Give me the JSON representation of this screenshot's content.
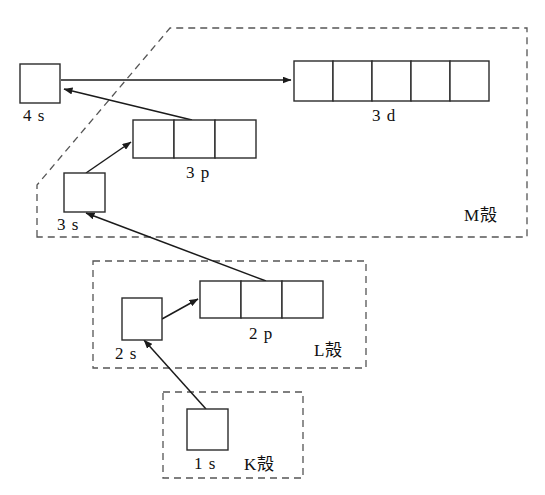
{
  "diagram": {
    "background_color": "#ffffff",
    "box_stroke_color": "#2b2b2b",
    "shell_stroke_color": "#555555",
    "arrow_color": "#1b1b1b"
  },
  "orbitals": [
    {
      "id": "4s",
      "label": "4 s",
      "boxes": 1,
      "x": 20,
      "y": 64,
      "box_w": 40,
      "box_h": 39,
      "label_x": 23,
      "label_y": 121
    },
    {
      "id": "3d",
      "label": "3 d",
      "boxes": 5,
      "x": 294,
      "y": 61,
      "box_w": 39,
      "box_h": 40,
      "label_x": 372,
      "label_y": 121
    },
    {
      "id": "3p",
      "label": "3 p",
      "boxes": 3,
      "x": 133,
      "y": 120,
      "box_w": 41,
      "box_h": 38,
      "label_x": 186,
      "label_y": 178
    },
    {
      "id": "3s",
      "label": "3 s",
      "boxes": 1,
      "x": 64,
      "y": 173,
      "box_w": 41,
      "box_h": 39,
      "label_x": 57,
      "label_y": 230
    },
    {
      "id": "2p",
      "label": "2 p",
      "boxes": 3,
      "x": 200,
      "y": 281,
      "box_w": 41,
      "box_h": 37,
      "label_x": 249,
      "label_y": 339
    },
    {
      "id": "2s",
      "label": "2 s",
      "boxes": 1,
      "x": 122,
      "y": 298,
      "box_w": 40,
      "box_h": 42,
      "label_x": 115,
      "label_y": 359
    },
    {
      "id": "1s",
      "label": "1 s",
      "boxes": 1,
      "x": 187,
      "y": 409,
      "box_w": 41,
      "box_h": 41,
      "label_x": 194,
      "label_y": 469
    }
  ],
  "shells": [
    {
      "id": "M",
      "label": "M殻",
      "label_x": 464,
      "label_y": 221
    },
    {
      "id": "L",
      "label": "L殻",
      "label_x": 314,
      "label_y": 356
    },
    {
      "id": "K",
      "label": "K殻",
      "label_x": 244,
      "label_y": 470
    }
  ],
  "arrows": [
    {
      "id": "4s-to-3d",
      "from": "4s",
      "to": "3d",
      "x1": 61,
      "y1": 80,
      "x2": 291,
      "y2": 80
    },
    {
      "id": "3p-to-4s",
      "from": "3p",
      "to": "4s",
      "x1": 192,
      "y1": 120,
      "x2": 64,
      "y2": 89
    },
    {
      "id": "3s-to-3p",
      "from": "3s",
      "to": "3p",
      "x1": 86,
      "y1": 173,
      "x2": 131,
      "y2": 142
    },
    {
      "id": "2p-to-3s",
      "from": "2p",
      "to": "3s",
      "x1": 266,
      "y1": 281,
      "x2": 86,
      "y2": 213
    },
    {
      "id": "2s-to-2p",
      "from": "2s",
      "to": "2p",
      "x1": 162,
      "y1": 319,
      "x2": 198,
      "y2": 299
    },
    {
      "id": "1s-to-2s",
      "from": "1s",
      "to": "2s",
      "x1": 206,
      "y1": 409,
      "x2": 144,
      "y2": 340
    }
  ],
  "shell_paths": {
    "M": "M 37,237 L 37,185 L 170,28 L 527,28 L 527,237 Z",
    "L": "M 93,261 L 366,261 L 366,368 L 93,368 Z",
    "K": "M 163,392 L 303,392 L 303,478 L 163,478 Z"
  }
}
